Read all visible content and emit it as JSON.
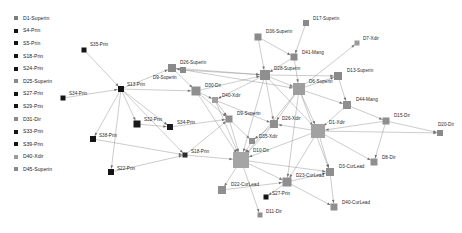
{
  "legend": {
    "items": [
      {
        "label": "D1-Superin",
        "color": "#7d7d7d",
        "shape": "square"
      },
      {
        "label": "S4-Prin",
        "color": "#141414",
        "shape": "square"
      },
      {
        "label": "S5-Prin",
        "color": "#141414",
        "shape": "square"
      },
      {
        "label": "S18-Prin",
        "color": "#141414",
        "shape": "square"
      },
      {
        "label": "S24-Prin",
        "color": "#141414",
        "shape": "square"
      },
      {
        "label": "D25-Superin",
        "color": "#8a8a8a",
        "shape": "square"
      },
      {
        "label": "S27-Prin",
        "color": "#141414",
        "shape": "square"
      },
      {
        "label": "S29-Prin",
        "color": "#141414",
        "shape": "square"
      },
      {
        "label": "D31-Dir",
        "color": "#8a8a8a",
        "shape": "square"
      },
      {
        "label": "S33-Prin",
        "color": "#141414",
        "shape": "square"
      },
      {
        "label": "S39-Prin",
        "color": "#141414",
        "shape": "square"
      },
      {
        "label": "D40-Xdir",
        "color": "#9a9a9a",
        "shape": "square"
      },
      {
        "label": "D45-Superin",
        "color": "#8a8a8a",
        "shape": "square"
      }
    ]
  },
  "chart_data": {
    "type": "scatter",
    "title": "",
    "xlabel": "",
    "ylabel": "",
    "layout": "force-directed network graph",
    "node_colors": {
      "school_principal": "#141414",
      "district_staff": "#8a8a8a",
      "district_hub": "#a8a8a8"
    },
    "edge_color": "#8c8c8c",
    "nodes": [
      {
        "id": "S35-Prin",
        "label": "S35-Prin",
        "x": 84,
        "y": 50,
        "size": 5,
        "color": "#141414",
        "lx": 6,
        "ly": -7
      },
      {
        "id": "S34-Prin",
        "label": "S34-Prin",
        "x": 63,
        "y": 98,
        "size": 5,
        "color": "#141414",
        "lx": 6,
        "ly": -6
      },
      {
        "id": "S13-Prin",
        "label": "S13-Prin",
        "x": 121,
        "y": 89,
        "size": 6,
        "color": "#141414",
        "lx": 6,
        "ly": -6
      },
      {
        "id": "S38-Prin",
        "label": "S38-Prin",
        "x": 93,
        "y": 139,
        "size": 6,
        "color": "#141414",
        "lx": 6,
        "ly": -5
      },
      {
        "id": "S22-Prin",
        "label": "S22-Prin",
        "x": 111,
        "y": 172,
        "size": 6,
        "color": "#141414",
        "lx": 6,
        "ly": -5
      },
      {
        "id": "S32-Prin",
        "label": "S32-Prin",
        "x": 137,
        "y": 124,
        "size": 7,
        "color": "#1a1a1a",
        "lx": 7,
        "ly": -6
      },
      {
        "id": "S34b-Prin",
        "label": "S34-Prin",
        "x": 170,
        "y": 127,
        "size": 6,
        "color": "#1c1c1c",
        "lx": 7,
        "ly": -6
      },
      {
        "id": "S18-Prin",
        "label": "S18-Prin",
        "x": 185,
        "y": 155,
        "size": 5,
        "color": "#2a2a2a",
        "lx": 6,
        "ly": -5
      },
      {
        "id": "D26-Superin",
        "label": "D26-Superin",
        "x": 172,
        "y": 68,
        "size": 8,
        "color": "#8a8a8a",
        "lx": 8,
        "ly": -7
      },
      {
        "id": "D30-Dir",
        "label": "D30-Dir",
        "x": 196,
        "y": 91,
        "size": 9,
        "color": "#8f8f8f",
        "lx": 9,
        "ly": -7
      },
      {
        "id": "D36-Superin",
        "label": "D36-Superin",
        "x": 258,
        "y": 37,
        "size": 7,
        "color": "#8a8a8a",
        "lx": 8,
        "ly": -7
      },
      {
        "id": "D17-Superin",
        "label": "D17-Superin",
        "x": 306,
        "y": 23,
        "size": 6,
        "color": "#8a8a8a",
        "lx": 7,
        "ly": -6
      },
      {
        "id": "D7-Xdir",
        "label": "D7-Xdir",
        "x": 357,
        "y": 43,
        "size": 5,
        "color": "#9a9a9a",
        "lx": 6,
        "ly": -6
      },
      {
        "id": "D41-Mang",
        "label": "D41-Mang",
        "x": 294,
        "y": 57,
        "size": 7,
        "color": "#8a8a8a",
        "lx": 8,
        "ly": -6
      },
      {
        "id": "D28-Superin",
        "label": "D28-Superin",
        "x": 265,
        "y": 75,
        "size": 10,
        "color": "#8f8f8f",
        "lx": 9,
        "ly": -8
      },
      {
        "id": "D13-Superin",
        "label": "D13-Superin",
        "x": 338,
        "y": 76,
        "size": 8,
        "color": "#8a8a8a",
        "lx": 9,
        "ly": -7
      },
      {
        "id": "D6-Superin",
        "label": "D6-Superin",
        "x": 299,
        "y": 89,
        "size": 12,
        "color": "#9e9e9e",
        "lx": 10,
        "ly": -9
      },
      {
        "id": "D44-Mang",
        "label": "D44-Mang",
        "x": 347,
        "y": 105,
        "size": 8,
        "color": "#8f8f8f",
        "lx": 9,
        "ly": -7
      },
      {
        "id": "D15-Dir",
        "label": "D15-Dir",
        "x": 386,
        "y": 121,
        "size": 7,
        "color": "#8f8f8f",
        "lx": 8,
        "ly": -7
      },
      {
        "id": "D20-Dir",
        "label": "D20-Dir",
        "x": 440,
        "y": 133,
        "size": 6,
        "color": "#8a8a8a",
        "lx": -2,
        "ly": -10
      },
      {
        "id": "D8-Dir",
        "label": "D8-Dir",
        "x": 374,
        "y": 162,
        "size": 7,
        "color": "#8f8f8f",
        "lx": 8,
        "ly": -6
      },
      {
        "id": "D40-Xdir",
        "label": "D40-Xdir",
        "x": 215,
        "y": 100,
        "size": 6,
        "color": "#a0a0a0",
        "lx": 7,
        "ly": -6
      },
      {
        "id": "D9-Superin",
        "label": "D9-Superin",
        "x": 229,
        "y": 119,
        "size": 7,
        "color": "#8f8f8f",
        "lx": 8,
        "ly": -7
      },
      {
        "id": "D26-Xdir",
        "label": "D26-Xdir",
        "x": 274,
        "y": 124,
        "size": 8,
        "color": "#8f8f8f",
        "lx": 8,
        "ly": -7
      },
      {
        "id": "D1-Xdir",
        "label": "D1-Xdir",
        "x": 318,
        "y": 131,
        "size": 14,
        "color": "#a2a2a2",
        "lx": 11,
        "ly": -10
      },
      {
        "id": "D35-Xdir",
        "label": "D35-Xdir",
        "x": 252,
        "y": 141,
        "size": 6,
        "color": "#8f8f8f",
        "lx": 7,
        "ly": -6
      },
      {
        "id": "D10-Dir",
        "label": "D10-Dir",
        "x": 241,
        "y": 160,
        "size": 16,
        "color": "#a5a5a5",
        "lx": 12,
        "ly": -11
      },
      {
        "id": "D22-CurLead",
        "label": "D22-CurLead",
        "x": 222,
        "y": 190,
        "size": 8,
        "color": "#8f8f8f",
        "lx": 9,
        "ly": -7
      },
      {
        "id": "D23-CurLead",
        "label": "D23-CurLead",
        "x": 287,
        "y": 182,
        "size": 9,
        "color": "#8f8f8f",
        "lx": 9,
        "ly": -8
      },
      {
        "id": "D3-CurLead",
        "label": "D3-CurLead",
        "x": 330,
        "y": 172,
        "size": 8,
        "color": "#8f8f8f",
        "lx": 9,
        "ly": -7
      },
      {
        "id": "D40-CurLead",
        "label": "D40-CurLead",
        "x": 334,
        "y": 207,
        "size": 7,
        "color": "#8f8f8f",
        "lx": 8,
        "ly": -6
      },
      {
        "id": "S27-Prin",
        "label": "S27-Prin",
        "x": 266,
        "y": 197,
        "size": 5,
        "color": "#141414",
        "lx": 6,
        "ly": -5
      },
      {
        "id": "D11-Dir",
        "label": "D11-Dir",
        "x": 260,
        "y": 215,
        "size": 5,
        "color": "#8f8f8f",
        "lx": 6,
        "ly": -5
      },
      {
        "id": "D9b-Superin",
        "label": "D9-Superin",
        "x": 183,
        "y": 70,
        "size": 6,
        "color": "#8a8a8a",
        "lx": -30,
        "ly": 6
      }
    ],
    "edges": [
      [
        "S35-Prin",
        "S13-Prin"
      ],
      [
        "S34-Prin",
        "S13-Prin"
      ],
      [
        "S13-Prin",
        "S38-Prin"
      ],
      [
        "S13-Prin",
        "S32-Prin"
      ],
      [
        "S13-Prin",
        "S34b-Prin"
      ],
      [
        "S13-Prin",
        "S18-Prin"
      ],
      [
        "S13-Prin",
        "D26-Superin"
      ],
      [
        "S13-Prin",
        "D30-Dir"
      ],
      [
        "S13-Prin",
        "S22-Prin"
      ],
      [
        "S38-Prin",
        "S18-Prin"
      ],
      [
        "S32-Prin",
        "S34b-Prin"
      ],
      [
        "S34b-Prin",
        "D9-Superin"
      ],
      [
        "S18-Prin",
        "D10-Dir"
      ],
      [
        "S18-Prin",
        "D9-Superin"
      ],
      [
        "S22-Prin",
        "S18-Prin"
      ],
      [
        "D26-Superin",
        "D28-Superin"
      ],
      [
        "D26-Superin",
        "D30-Dir"
      ],
      [
        "D26-Superin",
        "D6-Superin"
      ],
      [
        "D30-Dir",
        "D28-Superin"
      ],
      [
        "D30-Dir",
        "D40-Xdir"
      ],
      [
        "D30-Dir",
        "D9-Superin"
      ],
      [
        "D30-Dir",
        "D10-Dir"
      ],
      [
        "D36-Superin",
        "D28-Superin"
      ],
      [
        "D36-Superin",
        "D41-Mang"
      ],
      [
        "D17-Superin",
        "D41-Mang"
      ],
      [
        "D41-Mang",
        "D28-Superin"
      ],
      [
        "D41-Mang",
        "D6-Superin"
      ],
      [
        "D28-Superin",
        "D6-Superin"
      ],
      [
        "D28-Superin",
        "D40-Xdir"
      ],
      [
        "D28-Superin",
        "D26-Xdir"
      ],
      [
        "D28-Superin",
        "D1-Xdir"
      ],
      [
        "D28-Superin",
        "D10-Dir"
      ],
      [
        "D28-Superin",
        "D13-Superin"
      ],
      [
        "D6-Superin",
        "D13-Superin"
      ],
      [
        "D6-Superin",
        "D44-Mang"
      ],
      [
        "D6-Superin",
        "D1-Xdir"
      ],
      [
        "D6-Superin",
        "D26-Xdir"
      ],
      [
        "D6-Superin",
        "D10-Dir"
      ],
      [
        "D6-Superin",
        "D7-Xdir"
      ],
      [
        "D6-Superin",
        "D23-CurLead"
      ],
      [
        "D6-Superin",
        "D3-CurLead"
      ],
      [
        "D13-Superin",
        "D44-Mang"
      ],
      [
        "D44-Mang",
        "D15-Dir"
      ],
      [
        "D44-Mang",
        "D1-Xdir"
      ],
      [
        "D15-Dir",
        "D20-Dir"
      ],
      [
        "D15-Dir",
        "D8-Dir"
      ],
      [
        "D15-Dir",
        "D1-Xdir"
      ],
      [
        "D1-Xdir",
        "D20-Dir"
      ],
      [
        "D1-Xdir",
        "D8-Dir"
      ],
      [
        "D1-Xdir",
        "D26-Xdir"
      ],
      [
        "D1-Xdir",
        "D10-Dir"
      ],
      [
        "D1-Xdir",
        "D3-CurLead"
      ],
      [
        "D1-Xdir",
        "D23-CurLead"
      ],
      [
        "D40-Xdir",
        "D9-Superin"
      ],
      [
        "D40-Xdir",
        "D26-Xdir"
      ],
      [
        "D40-Xdir",
        "D10-Dir"
      ],
      [
        "D9-Superin",
        "D10-Dir"
      ],
      [
        "D9-Superin",
        "D35-Xdir"
      ],
      [
        "D26-Xdir",
        "D35-Xdir"
      ],
      [
        "D26-Xdir",
        "D10-Dir"
      ],
      [
        "D35-Xdir",
        "D10-Dir"
      ],
      [
        "D10-Dir",
        "D22-CurLead"
      ],
      [
        "D10-Dir",
        "D23-CurLead"
      ],
      [
        "D10-Dir",
        "D3-CurLead"
      ],
      [
        "D10-Dir",
        "D11-Dir"
      ],
      [
        "D23-CurLead",
        "D3-CurLead"
      ],
      [
        "D23-CurLead",
        "S27-Prin"
      ],
      [
        "D23-CurLead",
        "D40-CurLead"
      ],
      [
        "D3-CurLead",
        "D40-CurLead"
      ],
      [
        "D22-CurLead",
        "D23-CurLead"
      ],
      [
        "D9b-Superin",
        "D26-Superin"
      ],
      [
        "D9b-Superin",
        "D28-Superin"
      ]
    ]
  }
}
